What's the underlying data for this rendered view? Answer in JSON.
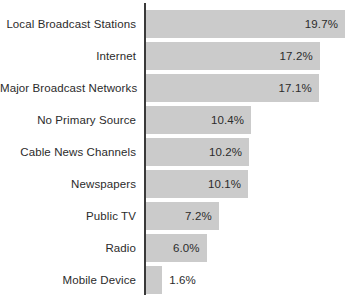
{
  "chart_data": {
    "type": "bar",
    "orientation": "horizontal",
    "title": "",
    "subtitle": "",
    "xlabel": "",
    "ylabel": "",
    "xlim": [
      0,
      21
    ],
    "grid": false,
    "legend": false,
    "value_suffix": "%",
    "categories": [
      "Local Broadcast Stations",
      "Internet",
      "Major Broadcast Networks",
      "No Primary Source",
      "Cable News Channels",
      "Newspapers",
      "Public TV",
      "Radio",
      "Mobile Device"
    ],
    "values": [
      19.7,
      17.2,
      17.1,
      10.4,
      10.2,
      10.1,
      7.2,
      6.0,
      1.6
    ],
    "value_labels": [
      "19.7%",
      "17.2%",
      "17.1%",
      "10.4%",
      "10.2%",
      "10.1%",
      "7.2%",
      "6.0%",
      "1.6%"
    ],
    "bars": [
      {
        "category": "Local Broadcast Stations",
        "value": 19.7,
        "label": "19.7%",
        "label_position": "inside"
      },
      {
        "category": "Internet",
        "value": 17.2,
        "label": "17.2%",
        "label_position": "inside"
      },
      {
        "category": "Major Broadcast Networks",
        "value": 17.1,
        "label": "17.1%",
        "label_position": "inside"
      },
      {
        "category": "No Primary Source",
        "value": 10.4,
        "label": "10.4%",
        "label_position": "inside"
      },
      {
        "category": "Cable News Channels",
        "value": 10.2,
        "label": "10.2%",
        "label_position": "inside"
      },
      {
        "category": "Newspapers",
        "value": 10.1,
        "label": "10.1%",
        "label_position": "inside"
      },
      {
        "category": "Public TV",
        "value": 7.2,
        "label": "7.2%",
        "label_position": "inside"
      },
      {
        "category": "Radio",
        "value": 6.0,
        "label": "6.0%",
        "label_position": "inside"
      },
      {
        "category": "Mobile Device",
        "value": 1.6,
        "label": "1.6%",
        "label_position": "outside"
      }
    ],
    "colors": {
      "bar": "#cbcbcb",
      "axis": "#3a3a3a",
      "text": "#2b2b2b",
      "background": "#ffffff"
    },
    "layout": {
      "axis_x": 146,
      "bar_start_x": 146,
      "px_per_unit": 10.1,
      "bar_height": 28,
      "row_pitch": 32,
      "first_row_top": 10
    }
  }
}
